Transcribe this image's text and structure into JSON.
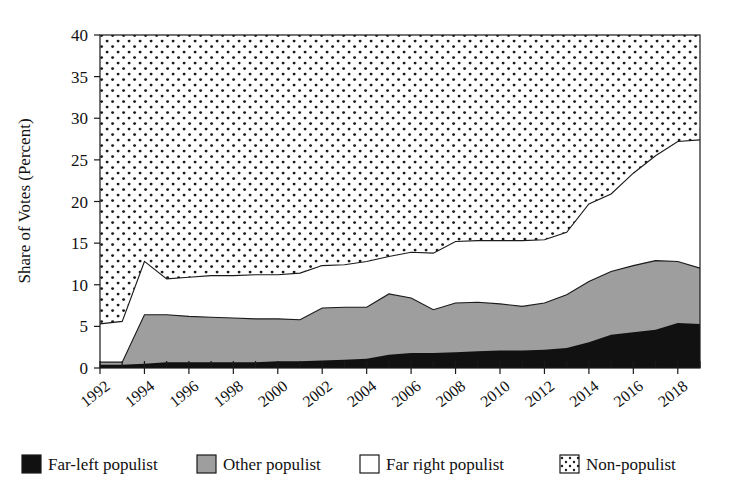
{
  "chart_data": {
    "type": "area",
    "title": "",
    "subtitle": "",
    "xlabel": "",
    "ylabel": "Share of Votes (Percent)",
    "xlim": [
      1992,
      2019
    ],
    "ylim": [
      0,
      40
    ],
    "grid": false,
    "stacked": true,
    "legend_position": "bottom",
    "x": [
      1992,
      1993,
      1994,
      1995,
      1996,
      1997,
      1998,
      1999,
      2000,
      2001,
      2002,
      2003,
      2004,
      2005,
      2006,
      2007,
      2008,
      2009,
      2010,
      2011,
      2012,
      2013,
      2014,
      2015,
      2016,
      2017,
      2018,
      2019
    ],
    "xticks": [
      1992,
      1994,
      1996,
      1998,
      2000,
      2002,
      2004,
      2006,
      2008,
      2010,
      2012,
      2014,
      2016,
      2018
    ],
    "xtick_labels": [
      "1992",
      "1994",
      "1996",
      "1998",
      "2000",
      "2002",
      "2004",
      "2006",
      "2008",
      "2010",
      "2012",
      "2014",
      "2016",
      "2018"
    ],
    "yticks": [
      0,
      5,
      10,
      15,
      20,
      25,
      30,
      35,
      40
    ],
    "ytick_labels": [
      "0",
      "5",
      "10",
      "15",
      "20",
      "25",
      "30",
      "35",
      "40"
    ],
    "series": [
      {
        "name": "Far-left populist",
        "color": "#111111",
        "pattern": "solid",
        "values": [
          0.4,
          0.4,
          0.5,
          0.7,
          0.7,
          0.7,
          0.7,
          0.7,
          0.8,
          0.8,
          0.9,
          1.0,
          1.1,
          1.6,
          1.8,
          1.8,
          1.9,
          2.0,
          2.1,
          2.1,
          2.2,
          2.4,
          3.1,
          4.0,
          4.3,
          4.6,
          5.4,
          5.3
        ]
      },
      {
        "name": "Other populist",
        "color": "#9e9e9e",
        "pattern": "solid",
        "values": [
          0.3,
          0.3,
          5.9,
          5.7,
          5.5,
          5.4,
          5.3,
          5.2,
          5.1,
          5.0,
          6.3,
          6.3,
          6.2,
          7.3,
          6.6,
          5.2,
          5.9,
          5.9,
          5.6,
          5.3,
          5.6,
          6.4,
          7.3,
          7.6,
          8.0,
          8.3,
          7.4,
          6.7
        ]
      },
      {
        "name": "Far right populist",
        "color": "#ffffff",
        "pattern": "solid",
        "values": [
          4.6,
          4.9,
          6.4,
          4.3,
          4.7,
          5.0,
          5.1,
          5.3,
          5.3,
          5.6,
          5.1,
          5.1,
          5.5,
          4.5,
          5.5,
          6.8,
          7.4,
          7.4,
          7.6,
          7.9,
          7.6,
          7.5,
          9.3,
          9.3,
          11.1,
          12.6,
          14.4,
          15.4
        ]
      },
      {
        "name": "Non-populist",
        "color": "#ffffff",
        "pattern": "dotted",
        "values": [
          34.7,
          34.4,
          27.2,
          29.3,
          29.1,
          28.9,
          28.9,
          28.8,
          28.8,
          28.6,
          27.7,
          27.6,
          27.2,
          26.6,
          26.1,
          26.2,
          24.8,
          24.7,
          24.7,
          24.7,
          24.6,
          23.7,
          20.3,
          19.1,
          16.6,
          14.5,
          12.8,
          12.6
        ]
      }
    ],
    "cumulative_top_boundaries": {
      "far_left": [
        0.4,
        0.4,
        0.5,
        0.7,
        0.7,
        0.7,
        0.7,
        0.7,
        0.8,
        0.8,
        0.9,
        1.0,
        1.1,
        1.6,
        1.8,
        1.8,
        1.9,
        2.0,
        2.1,
        2.1,
        2.2,
        2.4,
        3.1,
        4.0,
        4.3,
        4.6,
        5.4,
        5.3
      ],
      "other_populist": [
        0.7,
        0.7,
        6.4,
        6.4,
        6.2,
        6.1,
        6.0,
        5.9,
        5.9,
        5.8,
        7.2,
        7.3,
        7.3,
        8.9,
        8.4,
        7.0,
        7.8,
        7.9,
        7.7,
        7.4,
        7.8,
        8.8,
        10.4,
        11.6,
        12.3,
        12.9,
        12.8,
        12.0
      ],
      "far_right": [
        5.3,
        5.6,
        12.8,
        10.7,
        10.9,
        11.1,
        11.1,
        11.2,
        11.2,
        11.4,
        12.3,
        12.4,
        12.8,
        13.4,
        13.9,
        13.8,
        15.2,
        15.3,
        15.3,
        15.3,
        15.4,
        16.3,
        19.7,
        20.9,
        23.4,
        25.5,
        27.2,
        27.4
      ],
      "total": [
        40,
        40,
        40,
        40,
        40,
        40,
        40,
        40,
        40,
        40,
        40,
        40,
        40,
        40,
        40,
        40,
        40,
        40,
        40,
        40,
        40,
        40,
        40,
        40,
        40,
        40,
        40,
        40
      ]
    },
    "legend": [
      {
        "label": "Far-left populist",
        "swatch": "black-fill"
      },
      {
        "label": "Other populist",
        "swatch": "gray-fill"
      },
      {
        "label": "Far right populist",
        "swatch": "white-fill"
      },
      {
        "label": "Non-populist",
        "swatch": "dotted-fill"
      }
    ]
  },
  "colors": {
    "far_left": "#111111",
    "other_populist": "#9e9e9e",
    "far_right": "#ffffff",
    "non_populist_dots": "#1a1a1a",
    "axis": "#1a1a1a",
    "background": "#ffffff"
  }
}
